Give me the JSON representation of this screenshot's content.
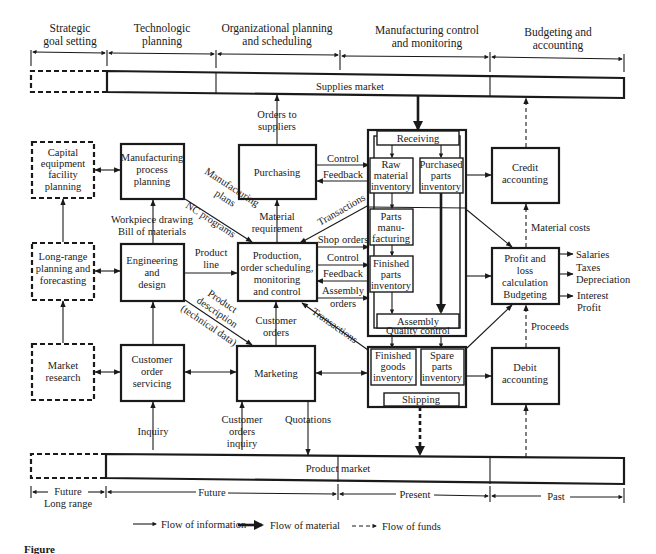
{
  "headers": [
    {
      "line1": "Strategic",
      "line2": "goal setting"
    },
    {
      "line1": "Technologic",
      "line2": "planning"
    },
    {
      "line1": "Organizational planning",
      "line2": "and scheduling"
    },
    {
      "line1": "Manufacturing control",
      "line2": "and monitoring"
    },
    {
      "line1": "Budgeting and",
      "line2": "accounting"
    }
  ],
  "markets": {
    "supplies": "Supplies market",
    "product": "Product market"
  },
  "boxes": {
    "capital": [
      "Capital",
      "equipment",
      "facility",
      "planning"
    ],
    "mpp": [
      "Manufacturing",
      "process",
      "planning"
    ],
    "purchasing": [
      "Purchasing"
    ],
    "longrange": [
      "Long-range",
      "planning and",
      "forecasting"
    ],
    "engineering": [
      "Engineering",
      "and",
      "design"
    ],
    "production": [
      "Production,",
      "order scheduling,",
      "monitoring",
      "and control"
    ],
    "market_research": [
      "Market",
      "research"
    ],
    "cos": [
      "Customer",
      "order",
      "servicing"
    ],
    "marketing": [
      "Marketing"
    ],
    "credit": [
      "Credit",
      "accounting"
    ],
    "profit": [
      "Profit and",
      "loss",
      "calculation",
      "Budgeting"
    ],
    "debit": [
      "Debit",
      "accounting"
    ]
  },
  "factory": {
    "receiving": "Receiving",
    "raw": [
      "Raw",
      "material",
      "inventory"
    ],
    "purchased": [
      "Purchased",
      "parts",
      "inventory"
    ],
    "parts_mfg": [
      "Parts",
      "manu-",
      "facturing"
    ],
    "finished_parts": [
      "Finished",
      "parts",
      "inventory"
    ],
    "assembly": "Assembly",
    "quality": "Quality control",
    "finished_goods": [
      "Finished",
      "goods",
      "inventory"
    ],
    "spare": [
      "Spare",
      "parts",
      "inventory"
    ],
    "shipping": "Shipping"
  },
  "labels": {
    "orders_to": "Orders to",
    "suppliers": "suppliers",
    "control": "Control",
    "feedback": "Feedback",
    "mfg_plans1": "Manufacturing",
    "mfg_plans2": "plans",
    "nc_programs": "NC programs",
    "workpiece": "Workpiece drawing",
    "bom": "Bill of materials",
    "material": "Material",
    "requirement": "requirement",
    "transactions": "Transactions",
    "shop_orders": "Shop orders",
    "control2": "Control",
    "feedback2": "Feedback",
    "assembly_orders1": "Assembly",
    "assembly_orders2": "orders",
    "product": "Product",
    "line": "line",
    "prod_desc1": "Product",
    "prod_desc2": "description",
    "prod_desc3": "(technical data)",
    "customer_orders1": "Customer",
    "customer_orders2": "orders",
    "transactions2": "Transactions",
    "inquiry": "Inquiry",
    "coi1": "Customer",
    "coi2": "orders",
    "coi3": "inquiry",
    "quotations": "Quotations",
    "material_costs": "Material costs",
    "salaries": "Salaries",
    "taxes": "Taxes",
    "depreciation": "Depreciation",
    "interest": "Interest",
    "profit": "Profit",
    "proceeds": "Proceeds"
  },
  "timeline": [
    {
      "line1": "Future",
      "line2": "Long range"
    },
    {
      "line1": "Future"
    },
    {
      "line1": "Present"
    },
    {
      "line1": "Past"
    }
  ],
  "legend": {
    "info": "Flow of information",
    "material": "Flow of material",
    "funds": "Flow of funds"
  },
  "caption": "Figure"
}
